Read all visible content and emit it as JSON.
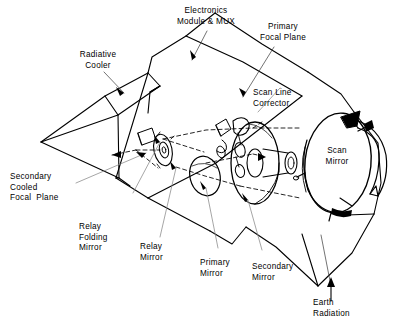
{
  "diagram": {
    "type": "technical-line-drawing",
    "stroke_color": "#000000",
    "background_color": "#ffffff",
    "leader_color": "#555555"
  },
  "labels": {
    "radiative_cooler": "Radiative\nCooler",
    "electronics_module": "Electronics\nModule & MUX",
    "primary_focal_plane": "Primary\nFocal Plane",
    "scan_line_corrector": "Scan Line\nCorrector",
    "scan_mirror": "Scan\nMirror",
    "secondary_cooled_focal_plane": "Secondary\nCooled\nFocal  Plane",
    "relay_folding_mirror": "Relay\nFolding\nMirror",
    "relay_mirror": "Relay\nMirror",
    "primary_mirror": "Primary\nMirror",
    "secondary_mirror": "Secondary\nMirror",
    "earth_radiation": "Earth\nRadiation"
  },
  "components": [
    {
      "name": "radiative-cooler",
      "label": "Radiative Cooler",
      "shape": "faceted-wedge"
    },
    {
      "name": "electronics-module",
      "label": "Electronics Module & MUX",
      "shape": "housing-panel"
    },
    {
      "name": "primary-focal-plane",
      "label": "Primary Focal Plane",
      "shape": "detector-array"
    },
    {
      "name": "scan-line-corrector",
      "label": "Scan Line Corrector",
      "shape": "small-mirror"
    },
    {
      "name": "scan-mirror",
      "label": "Scan Mirror",
      "shape": "large-ellipse-disk"
    },
    {
      "name": "secondary-cooled-focal-plane",
      "label": "Secondary Cooled Focal Plane",
      "shape": "cold-stage"
    },
    {
      "name": "relay-folding-mirror",
      "label": "Relay Folding Mirror",
      "shape": "tilted-flat"
    },
    {
      "name": "relay-mirror",
      "label": "Relay Mirror",
      "shape": "hubbed-disk"
    },
    {
      "name": "primary-mirror",
      "label": "Primary Mirror",
      "shape": "annular-disk"
    },
    {
      "name": "secondary-mirror",
      "label": "Secondary Mirror",
      "shape": "convex-ellipse"
    },
    {
      "name": "earth-radiation",
      "label": "Earth Radiation",
      "shape": "incoming-ray"
    }
  ],
  "annotations": {
    "rotation_arrow": "scan-mirror-rotation",
    "optical_path_style": "dashed",
    "leader_line_style": "thin-solid"
  }
}
